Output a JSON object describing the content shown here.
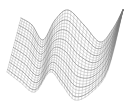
{
  "figure": {
    "type": "3d-wireframe-surface",
    "background": "#ffffff",
    "mesh_color": "#8a8a8a",
    "mesh_color_dark": "#5a5a5a",
    "axes_visible": false,
    "text_visible": false
  },
  "surface": {
    "description": "Wavy sinusoidal surface mesh with two crests (left and center) and a rising right edge",
    "rows": 22,
    "cols": 40,
    "u_range": [
      0,
      1
    ],
    "v_range": [
      0,
      1
    ]
  },
  "projection": {
    "top_curve": [
      [
        21,
        18
      ],
      [
        32,
        25
      ],
      [
        43,
        40
      ],
      [
        55,
        20
      ],
      [
        68,
        10
      ],
      [
        84,
        25
      ],
      [
        100,
        42
      ],
      [
        112,
        30
      ],
      [
        123,
        10
      ]
    ],
    "bottom_curve": [
      [
        7,
        72
      ],
      [
        20,
        82
      ],
      [
        35,
        92
      ],
      [
        50,
        72
      ],
      [
        62,
        85
      ],
      [
        75,
        100
      ],
      [
        92,
        92
      ],
      [
        108,
        70
      ],
      [
        123,
        10
      ]
    ]
  }
}
